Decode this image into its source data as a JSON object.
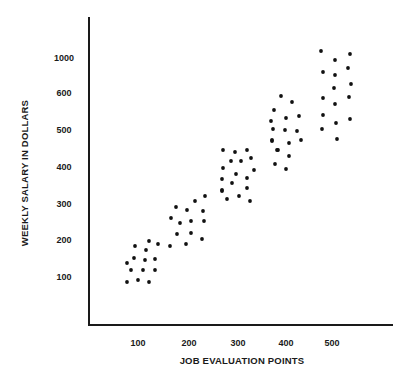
{
  "chart_data": {
    "type": "scatter",
    "title": "",
    "xlabel": "JOB EVALUATION POINTS",
    "ylabel": "WEEKLY SALARY IN DOLLARS",
    "x_ticks": [
      "100",
      "200",
      "300",
      "400",
      "500"
    ],
    "y_ticks": [
      "100",
      "200",
      "300",
      "400",
      "500",
      "600",
      "1000"
    ],
    "xlim": [
      0,
      600
    ],
    "ylim": [
      0,
      1100
    ],
    "grid": false,
    "legend": null,
    "note": "Y axis tick spacing is uneven (600 to 1000 occupies one step)",
    "series": [
      {
        "name": "Jobs",
        "points": [
          {
            "x": 78,
            "y": 90
          },
          {
            "x": 100,
            "y": 95
          },
          {
            "x": 122,
            "y": 90
          },
          {
            "x": 86,
            "y": 120
          },
          {
            "x": 110,
            "y": 120
          },
          {
            "x": 135,
            "y": 120
          },
          {
            "x": 78,
            "y": 140
          },
          {
            "x": 92,
            "y": 155
          },
          {
            "x": 114,
            "y": 150
          },
          {
            "x": 135,
            "y": 150
          },
          {
            "x": 94,
            "y": 185
          },
          {
            "x": 116,
            "y": 175
          },
          {
            "x": 122,
            "y": 200
          },
          {
            "x": 140,
            "y": 190
          },
          {
            "x": 165,
            "y": 185
          },
          {
            "x": 198,
            "y": 190
          },
          {
            "x": 230,
            "y": 205
          },
          {
            "x": 180,
            "y": 225
          },
          {
            "x": 208,
            "y": 220
          },
          {
            "x": 230,
            "y": 240
          },
          {
            "x": 165,
            "y": 260
          },
          {
            "x": 185,
            "y": 250
          },
          {
            "x": 208,
            "y": 255
          },
          {
            "x": 235,
            "y": 255
          },
          {
            "x": 178,
            "y": 280
          },
          {
            "x": 200,
            "y": 285
          },
          {
            "x": 235,
            "y": 290
          },
          {
            "x": 215,
            "y": 305
          },
          {
            "x": 237,
            "y": 320
          },
          {
            "x": 272,
            "y": 310
          },
          {
            "x": 296,
            "y": 315
          },
          {
            "x": 318,
            "y": 305
          },
          {
            "x": 272,
            "y": 340
          },
          {
            "x": 318,
            "y": 345
          },
          {
            "x": 272,
            "y": 370
          },
          {
            "x": 292,
            "y": 360
          },
          {
            "x": 318,
            "y": 375
          },
          {
            "x": 274,
            "y": 400
          },
          {
            "x": 300,
            "y": 390
          },
          {
            "x": 336,
            "y": 395
          },
          {
            "x": 290,
            "y": 420
          },
          {
            "x": 310,
            "y": 420
          },
          {
            "x": 330,
            "y": 425
          },
          {
            "x": 274,
            "y": 445
          },
          {
            "x": 298,
            "y": 440
          },
          {
            "x": 322,
            "y": 445
          },
          {
            "x": 374,
            "y": 400
          },
          {
            "x": 396,
            "y": 395
          },
          {
            "x": 420,
            "y": 410
          },
          {
            "x": 376,
            "y": 420
          },
          {
            "x": 404,
            "y": 430
          },
          {
            "x": 434,
            "y": 420
          },
          {
            "x": 370,
            "y": 450
          },
          {
            "x": 392,
            "y": 445
          },
          {
            "x": 404,
            "y": 460
          },
          {
            "x": 428,
            "y": 460
          },
          {
            "x": 376,
            "y": 480
          },
          {
            "x": 400,
            "y": 480
          },
          {
            "x": 424,
            "y": 475
          },
          {
            "x": 370,
            "y": 510
          },
          {
            "x": 374,
            "y": 520
          },
          {
            "x": 398,
            "y": 500
          },
          {
            "x": 424,
            "y": 505
          },
          {
            "x": 376,
            "y": 530
          },
          {
            "x": 398,
            "y": 535
          },
          {
            "x": 434,
            "y": 535
          },
          {
            "x": 378,
            "y": 550
          },
          {
            "x": 402,
            "y": 575
          },
          {
            "x": 424,
            "y": 560
          },
          {
            "x": 474,
            "y": 500
          },
          {
            "x": 505,
            "y": 470
          },
          {
            "x": 530,
            "y": 520
          },
          {
            "x": 476,
            "y": 530
          },
          {
            "x": 504,
            "y": 515
          },
          {
            "x": 476,
            "y": 560
          },
          {
            "x": 510,
            "y": 545
          },
          {
            "x": 528,
            "y": 590
          },
          {
            "x": 476,
            "y": 600
          },
          {
            "x": 508,
            "y": 590
          },
          {
            "x": 530,
            "y": 600
          },
          {
            "x": 504,
            "y": 650
          },
          {
            "x": 535,
            "y": 625
          },
          {
            "x": 476,
            "y": 660
          },
          {
            "x": 504,
            "y": 700
          },
          {
            "x": 530,
            "y": 680
          },
          {
            "x": 500,
            "y": 800
          },
          {
            "x": 528,
            "y": 760
          },
          {
            "x": 474,
            "y": 1000
          },
          {
            "x": 508,
            "y": 960
          },
          {
            "x": 535,
            "y": 1000
          }
        ]
      }
    ]
  },
  "render": {
    "axis": {
      "x0": 89,
      "y_top": 17,
      "y_bottom": 325,
      "x_right": 393
    },
    "x_tick_positions": [
      138,
      189,
      238,
      286,
      332
    ],
    "x_tick_label_y": 346,
    "y_tick_positions": [
      277,
      240,
      204,
      167,
      130,
      93,
      58
    ],
    "y_tick_label_x": 64,
    "xlabel_pos": {
      "x": 242,
      "y": 364
    },
    "ylabel_pos": {
      "x": 28,
      "y": 173
    },
    "dot_radius": 1.9,
    "dots_px": [
      [
        127,
        282
      ],
      [
        138,
        280
      ],
      [
        149,
        282
      ],
      [
        131,
        270
      ],
      [
        143,
        270
      ],
      [
        155,
        270
      ],
      [
        127,
        263
      ],
      [
        134,
        258
      ],
      [
        145,
        260
      ],
      [
        155,
        259
      ],
      [
        135,
        246
      ],
      [
        146,
        250
      ],
      [
        149,
        241
      ],
      [
        158,
        244
      ],
      [
        170,
        246
      ],
      [
        186,
        244
      ],
      [
        202,
        239
      ],
      [
        177,
        234
      ],
      [
        191,
        233
      ],
      [
        204,
        221
      ],
      [
        171,
        218
      ],
      [
        180,
        223
      ],
      [
        191,
        221
      ],
      [
        203,
        211
      ],
      [
        176,
        207
      ],
      [
        187,
        210
      ],
      [
        195,
        201
      ],
      [
        205,
        196
      ],
      [
        222,
        191
      ],
      [
        222,
        190
      ],
      [
        227,
        199
      ],
      [
        239,
        196
      ],
      [
        250,
        201
      ],
      [
        247,
        188
      ],
      [
        222,
        179
      ],
      [
        232,
        183
      ],
      [
        247,
        178
      ],
      [
        223,
        168
      ],
      [
        236,
        174
      ],
      [
        254,
        170
      ],
      [
        231,
        161
      ],
      [
        241,
        161
      ],
      [
        251,
        158
      ],
      [
        223,
        150
      ],
      [
        235,
        152
      ],
      [
        247,
        150
      ],
      [
        272,
        141
      ],
      [
        289,
        143
      ],
      [
        301,
        140
      ],
      [
        278,
        150
      ],
      [
        289,
        156
      ],
      [
        272,
        140
      ],
      [
        273,
        129
      ],
      [
        285,
        130
      ],
      [
        297,
        131
      ],
      [
        271,
        121
      ],
      [
        286,
        118
      ],
      [
        299,
        116
      ],
      [
        274,
        110
      ],
      [
        292,
        102
      ],
      [
        281,
        96
      ],
      [
        275,
        164
      ],
      [
        286,
        169
      ],
      [
        277,
        150
      ],
      [
        322,
        129
      ],
      [
        337,
        139
      ],
      [
        336,
        123
      ],
      [
        323,
        115
      ],
      [
        350,
        119
      ],
      [
        323,
        98
      ],
      [
        335,
        104
      ],
      [
        349,
        97
      ],
      [
        334,
        88
      ],
      [
        351,
        84
      ],
      [
        323,
        72
      ],
      [
        335,
        75
      ],
      [
        348,
        68
      ],
      [
        321,
        51
      ],
      [
        335,
        60
      ],
      [
        350,
        54
      ]
    ]
  }
}
